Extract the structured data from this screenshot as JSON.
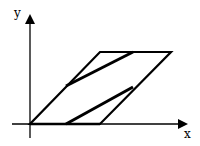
{
  "diagram": {
    "axes": {
      "x_label": "x",
      "y_label": "y",
      "origin": [
        30,
        124
      ]
    },
    "parallelogram": {
      "vertices": [
        [
          30,
          124
        ],
        [
          100,
          124
        ],
        [
          171,
          52
        ],
        [
          100,
          52
        ]
      ]
    },
    "inner_segments": [
      {
        "from": [
          66,
          86
        ],
        "to": [
          133,
          52
        ]
      },
      {
        "from": [
          66,
          124
        ],
        "to": [
          133,
          87
        ]
      }
    ],
    "colors": {
      "stroke": "#000000",
      "background": "#ffffff"
    }
  }
}
